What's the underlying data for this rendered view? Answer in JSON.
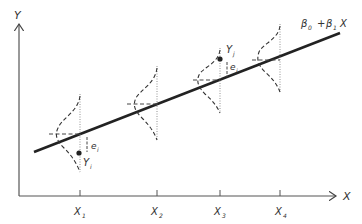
{
  "axes": {
    "y_label": "Y",
    "x_label": "X"
  },
  "regression_label": {
    "b0": "β",
    "b0_sub": "0",
    "plus": "+",
    "b1": "β",
    "b1_sub": "1",
    "x": "X"
  },
  "ticks": [
    {
      "label": "X",
      "sub": "1"
    },
    {
      "label": "X",
      "sub": "2"
    },
    {
      "label": "X",
      "sub": "3"
    },
    {
      "label": "X",
      "sub": "4"
    }
  ],
  "points": [
    {
      "label": "Y",
      "sub": "i",
      "error": "e",
      "error_sub": "i"
    },
    {
      "label": "Y",
      "sub": "j",
      "error": "e",
      "error_sub": "j"
    }
  ],
  "colors": {
    "ink": "#333333",
    "background": "#ffffff"
  }
}
